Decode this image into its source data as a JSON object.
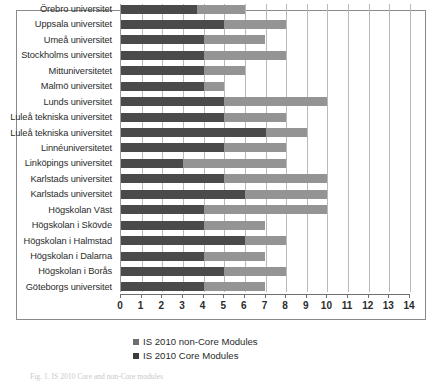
{
  "figure": {
    "caption": "Fig. 1. IS 2010 Core and non-Core modules"
  },
  "legend": {
    "position": "below-axis",
    "items": [
      {
        "label": "IS 2010 non-Core Modules",
        "color": "#6e6e6e",
        "swatch_name": "legend-swatch-non-core"
      },
      {
        "label": "IS 2010 Core Modules",
        "color": "#3c3c3c",
        "swatch_name": "legend-swatch-core"
      }
    ]
  },
  "axis": {
    "x_ticks": [
      "0",
      "1",
      "2",
      "3",
      "4",
      "5",
      "6",
      "7",
      "8",
      "9",
      "10",
      "11",
      "12",
      "13",
      "14"
    ]
  },
  "chart_data": {
    "type": "bar",
    "orientation": "horizontal",
    "stacked": true,
    "title": "",
    "xlabel": "",
    "ylabel": "",
    "xlim": [
      0,
      14
    ],
    "grid": true,
    "legend_position": "bottom-left",
    "categories": [
      "Örebro universitet",
      "Uppsala universitet",
      "Umeå universitet",
      "Stockholms universitet",
      "Mittuniversitetet",
      "Malmö universitet",
      "Lunds universitet",
      "Luleå tekniska universitet",
      "Luleå tekniska universitet",
      "Linnéuniversitetet",
      "Linköpings universitet",
      "Karlstads universitet",
      "Karlstads universitet",
      "Högskolan Väst",
      "Högskolan i Skövde",
      "Högskolan i Halmstad",
      "Högskolan i Dalarna",
      "Högskolan i Borås",
      "Göteborgs universitet"
    ],
    "series": [
      {
        "name": "IS 2010 Core Modules",
        "color": "#4a4a4a",
        "values": [
          3.7,
          5.0,
          4.0,
          4.0,
          4.0,
          4.0,
          5.0,
          5.0,
          7.0,
          5.0,
          3.0,
          5.0,
          6.0,
          4.0,
          4.0,
          6.0,
          4.0,
          5.0,
          4.0
        ]
      },
      {
        "name": "IS 2010 non-Core Modules",
        "color": "#949494",
        "values": [
          2.3,
          3.0,
          3.0,
          4.0,
          2.0,
          1.0,
          5.0,
          3.0,
          2.0,
          3.0,
          5.0,
          5.0,
          4.0,
          6.0,
          3.0,
          2.0,
          3.0,
          3.0,
          3.0
        ]
      }
    ],
    "totals": [
      6.0,
      8.0,
      7.0,
      8.0,
      6.0,
      5.0,
      10.0,
      8.0,
      9.0,
      8.0,
      8.0,
      10.0,
      10.0,
      10.0,
      7.0,
      8.0,
      7.0,
      8.0,
      7.0
    ]
  }
}
